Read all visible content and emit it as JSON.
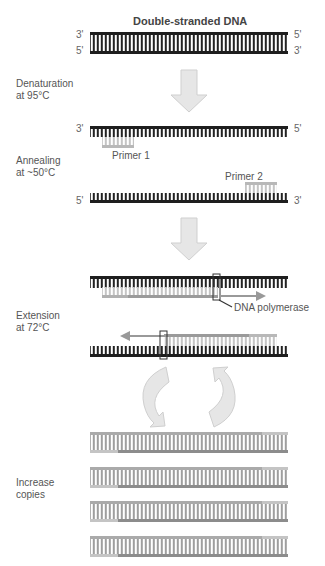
{
  "title": "Double-stranded DNA",
  "steps": {
    "denaturation": {
      "line1": "Denaturation",
      "line2": "at 95°C"
    },
    "annealing": {
      "line1": "Annealing",
      "line2": "at ~50°C"
    },
    "extension": {
      "line1": "Extension",
      "line2": "at 72°C"
    },
    "increase": {
      "line1": "Increase",
      "line2": "copies"
    }
  },
  "labels": {
    "primer1": "Primer 1",
    "primer2": "Primer 2",
    "polymerase": "DNA polymerase"
  },
  "ends": {
    "ds_top_left": "3'",
    "ds_top_right": "5'",
    "ds_bot_left": "5'",
    "ds_bot_right": "3'",
    "ann_top_left": "3'",
    "ann_top_right": "5'",
    "ann_bot_left": "5'",
    "ann_bot_right": "3'"
  },
  "colors": {
    "template_strand": "#1e1e1e",
    "new_strand": "#9a9a9a",
    "primer": "#b8b8b8",
    "arrow_fill": "#e6e6e6",
    "arrow_stroke": "#cfcfcf"
  }
}
